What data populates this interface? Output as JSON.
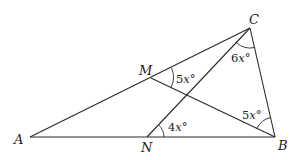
{
  "diagram": {
    "points": {
      "A": {
        "label": "A",
        "x": 30,
        "y": 137
      },
      "B": {
        "label": "B",
        "x": 275,
        "y": 137
      },
      "C": {
        "label": "C",
        "x": 250,
        "y": 28
      },
      "M": {
        "label": "M",
        "x": 151,
        "y": 78
      },
      "N": {
        "label": "N",
        "x": 147,
        "y": 137
      }
    },
    "segments": [
      "AB",
      "AC",
      "BC",
      "MB",
      "NC"
    ],
    "angles": {
      "angle_C": {
        "coef": "6",
        "var": "x",
        "unit": "°",
        "vertex": "C",
        "between": "NC-BC"
      },
      "angle_M": {
        "coef": "5",
        "var": "x",
        "unit": "°",
        "vertex": "M",
        "between": "MC-MB"
      },
      "angle_B": {
        "coef": "5",
        "var": "x",
        "unit": "°",
        "vertex": "B",
        "between": "BM-BC"
      },
      "angle_N": {
        "coef": "4",
        "var": "x",
        "unit": "°",
        "vertex": "N",
        "between": "NB-NC"
      }
    }
  }
}
